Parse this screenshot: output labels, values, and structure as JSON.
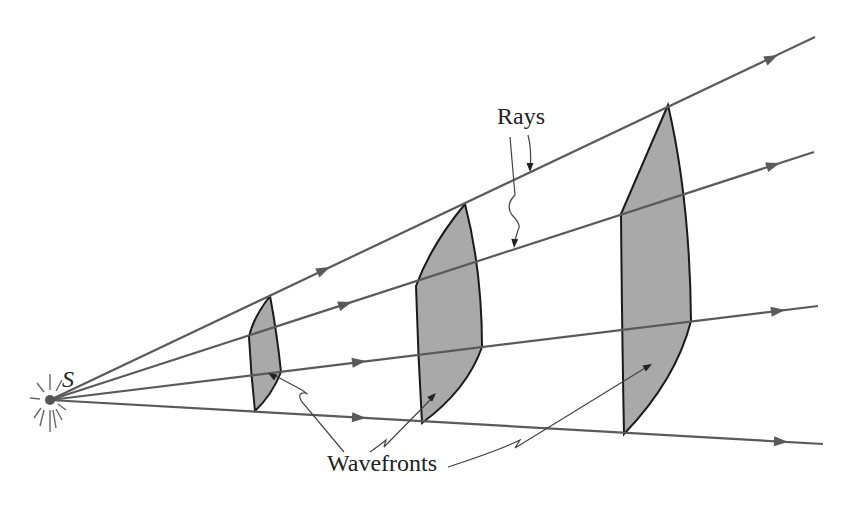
{
  "figure": {
    "type": "physics-diagram"
  },
  "labels": {
    "source": "S",
    "rays": "Rays",
    "wavefronts": "Wavefronts"
  },
  "colors": {
    "ray": "#5a5a5a",
    "wavefront_fill": "#a9a9a9",
    "wavefront_stroke": "#1a1a1a",
    "background": "#ffffff"
  },
  "source_point": {
    "x": 50,
    "y": 400
  },
  "rays": [
    {
      "id": "ray-1",
      "end": {
        "x": 815,
        "y": 37
      }
    },
    {
      "id": "ray-2",
      "end": {
        "x": 814,
        "y": 152
      }
    },
    {
      "id": "ray-3",
      "end": {
        "x": 818,
        "y": 306
      }
    },
    {
      "id": "ray-4",
      "end": {
        "x": 823,
        "y": 444
      }
    }
  ],
  "wavefronts": [
    {
      "id": "wavefront-small",
      "label": "near"
    },
    {
      "id": "wavefront-medium",
      "label": "middle"
    },
    {
      "id": "wavefront-large",
      "label": "far"
    }
  ]
}
